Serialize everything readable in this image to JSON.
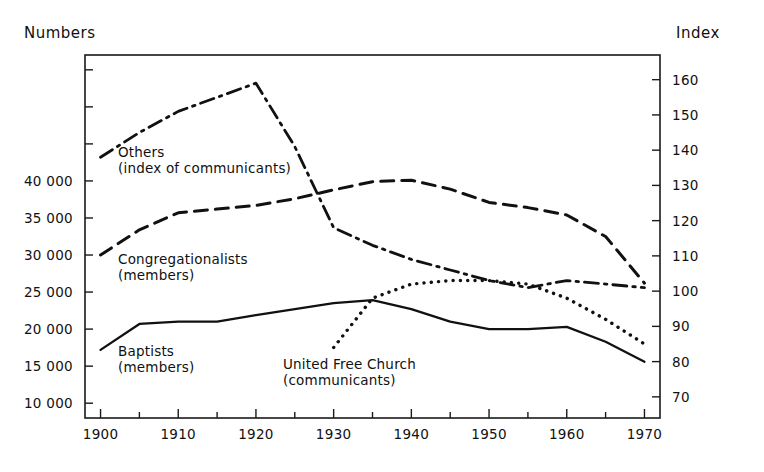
{
  "axes": {
    "left_caption": "Numbers",
    "right_caption": "Index",
    "left_ticks": [
      "40 000",
      "35 000",
      "30 000",
      "25 000",
      "20 000",
      "15 000",
      "10 000"
    ],
    "right_ticks": [
      "160",
      "150",
      "140",
      "130",
      "120",
      "110",
      "100",
      "90",
      "80",
      "70"
    ],
    "bottom_ticks": [
      "1900",
      "1910",
      "1920",
      "1930",
      "1940",
      "1950",
      "1960",
      "1970"
    ]
  },
  "series_labels": {
    "others": {
      "line1": "Others",
      "line2": "(index of communicants)"
    },
    "congregationalists": {
      "line1": "Congregationalists",
      "line2": "(members)"
    },
    "baptists": {
      "line1": "Baptists",
      "line2": "(members)"
    },
    "united_free_church": {
      "line1": "United Free Church",
      "line2": "(communicants)"
    }
  },
  "chart_data": {
    "type": "line",
    "title": "",
    "subtitle": "",
    "xlabel": "",
    "ylabel": "Numbers",
    "y2label": "Index",
    "xlim": [
      1898,
      1972
    ],
    "ylim": [
      8000,
      57000
    ],
    "y2lim": [
      64,
      167
    ],
    "grid": false,
    "legend": "inline-annotations",
    "x_major_ticks": [
      1900,
      1910,
      1920,
      1930,
      1940,
      1950,
      1960,
      1970
    ],
    "x_minor_ticks": [
      1905,
      1915,
      1925,
      1935,
      1945,
      1955,
      1965
    ],
    "y_left_ticks": [
      10000,
      15000,
      20000,
      25000,
      30000,
      35000,
      40000
    ],
    "y_left_unlabeled_ticks": [
      45000,
      50000,
      55000
    ],
    "y_right_ticks": [
      70,
      80,
      90,
      100,
      110,
      120,
      130,
      140,
      150,
      160
    ],
    "series": [
      {
        "name": "Others (index of communicants)",
        "axis": "right",
        "units": "index",
        "style": "dash-dot",
        "x": [
          1900,
          1905,
          1910,
          1915,
          1920,
          1925,
          1930,
          1935,
          1940,
          1945,
          1950,
          1955,
          1960,
          1965,
          1970
        ],
        "values": [
          138,
          145,
          151,
          155,
          159,
          141,
          118,
          113,
          109,
          106,
          103,
          101,
          103,
          102,
          101
        ]
      },
      {
        "name": "Congregationalists (members)",
        "axis": "left",
        "units": "members",
        "style": "dashed",
        "x": [
          1900,
          1905,
          1910,
          1915,
          1920,
          1925,
          1930,
          1935,
          1940,
          1945,
          1950,
          1955,
          1960,
          1965,
          1970
        ],
        "values": [
          30000,
          33400,
          35700,
          36200,
          36700,
          37600,
          38800,
          39900,
          40100,
          38900,
          37100,
          36400,
          35400,
          32500,
          26200
        ]
      },
      {
        "name": "Baptists (members)",
        "axis": "left",
        "units": "members",
        "style": "solid",
        "x": [
          1900,
          1905,
          1910,
          1915,
          1920,
          1925,
          1930,
          1935,
          1940,
          1945,
          1950,
          1955,
          1960,
          1965,
          1970
        ],
        "values": [
          17200,
          20700,
          21000,
          21000,
          21900,
          22700,
          23500,
          23900,
          22700,
          21000,
          20000,
          20000,
          20300,
          18300,
          15600
        ]
      },
      {
        "name": "United Free Church (communicants)",
        "axis": "right",
        "units": "communicants index",
        "style": "dotted",
        "x": [
          1930,
          1935,
          1940,
          1945,
          1950,
          1955,
          1960,
          1965,
          1970
        ],
        "values": [
          84,
          98,
          102,
          103,
          103,
          102,
          98,
          92,
          85
        ]
      }
    ]
  }
}
